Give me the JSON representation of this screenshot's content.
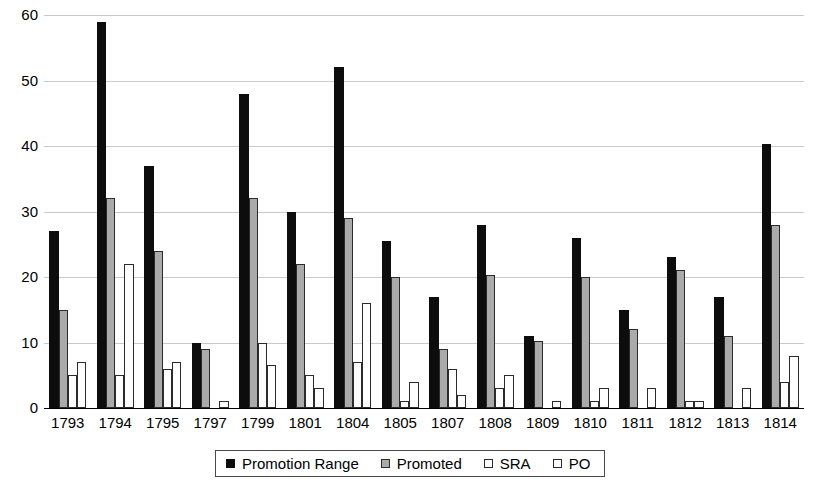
{
  "chart_data": {
    "type": "bar",
    "title": "",
    "subtitle": "",
    "xlabel": "",
    "ylabel": "",
    "ylim": [
      0,
      60
    ],
    "ytick_labels": [
      "0",
      "10",
      "20",
      "30",
      "40",
      "50",
      "60"
    ],
    "ytick_values": [
      0,
      10,
      20,
      30,
      40,
      50,
      60
    ],
    "grid": true,
    "legend_position": "bottom",
    "categories": [
      "1793",
      "1794",
      "1795",
      "1797",
      "1799",
      "1801",
      "1804",
      "1805",
      "1807",
      "1808",
      "1809",
      "1810",
      "1811",
      "1812",
      "1813",
      "1814"
    ],
    "series": [
      {
        "name": "Promotion Range",
        "color": "#0d0d0d",
        "values": [
          27,
          59,
          37,
          10,
          48,
          30,
          52,
          25.5,
          17,
          28,
          11,
          26,
          15,
          23,
          17,
          40.3
        ]
      },
      {
        "name": "Promoted",
        "color": "#aaaaaa",
        "values": [
          15,
          32,
          24,
          9,
          32,
          22,
          29,
          20,
          9,
          20.3,
          10.3,
          20,
          12,
          21,
          11,
          28
        ]
      },
      {
        "name": "SRA",
        "color": "#ffffff",
        "values": [
          5,
          5,
          6,
          0,
          10,
          5,
          7,
          1,
          6,
          3,
          0,
          1,
          0,
          1,
          0,
          4
        ]
      },
      {
        "name": "PO",
        "color": "#ffffff",
        "values": [
          7,
          22,
          7,
          1,
          6.5,
          3,
          16,
          4,
          2,
          5,
          1,
          3,
          3,
          1,
          3,
          8
        ]
      }
    ]
  },
  "legend": {
    "entries": [
      {
        "label": "Promotion Range",
        "swatch": "black-square-icon"
      },
      {
        "label": "Promoted",
        "swatch": "gray-square-icon"
      },
      {
        "label": "SRA",
        "swatch": "white-square-icon"
      },
      {
        "label": "PO",
        "swatch": "white-square-icon"
      }
    ]
  }
}
